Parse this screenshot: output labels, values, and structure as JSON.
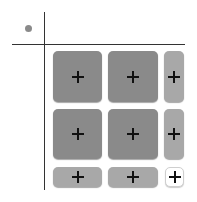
{
  "colors": {
    "big_cell": "#8a8a8a",
    "narrow_cell": "#a8a8a8",
    "empty_cell": "#ffffff",
    "axis": "#333333",
    "corner_dot": "#8a8a8a"
  },
  "grid": {
    "rows": 3,
    "cols": 3,
    "cells": [
      {
        "row": 0,
        "col": 0,
        "type": "big",
        "icon": "plus-icon"
      },
      {
        "row": 0,
        "col": 1,
        "type": "big",
        "icon": "plus-icon"
      },
      {
        "row": 0,
        "col": 2,
        "type": "narrow",
        "icon": "plus-icon"
      },
      {
        "row": 1,
        "col": 0,
        "type": "big",
        "icon": "plus-icon"
      },
      {
        "row": 1,
        "col": 1,
        "type": "big",
        "icon": "plus-icon"
      },
      {
        "row": 1,
        "col": 2,
        "type": "narrow",
        "icon": "plus-icon"
      },
      {
        "row": 2,
        "col": 0,
        "type": "narrow",
        "icon": "plus-icon"
      },
      {
        "row": 2,
        "col": 1,
        "type": "narrow",
        "icon": "plus-icon"
      },
      {
        "row": 2,
        "col": 2,
        "type": "empty",
        "icon": "plus-icon"
      }
    ]
  }
}
